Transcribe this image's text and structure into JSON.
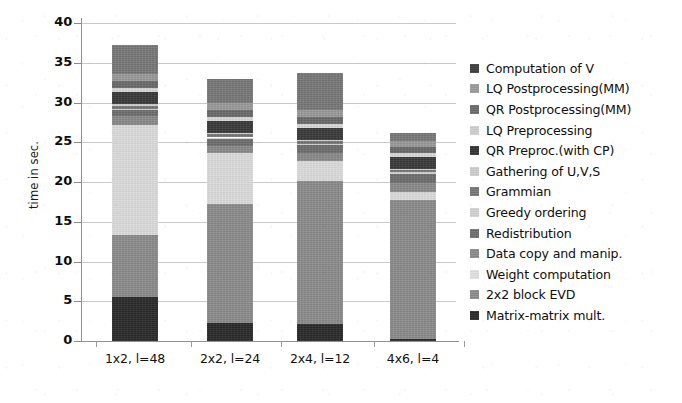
{
  "chart_data": {
    "type": "bar",
    "variant": "stacked",
    "title": "",
    "xlabel": "",
    "ylabel": "time in sec.",
    "ylim": [
      0,
      40
    ],
    "ytick_values": [
      0,
      5,
      10,
      15,
      20,
      25,
      30,
      35,
      40
    ],
    "ytick_labels": [
      "0",
      "5",
      "10",
      "15",
      "20",
      "25",
      "30",
      "35",
      "40"
    ],
    "grid": true,
    "legend_position": "right",
    "categories": [
      "1x2, l=48",
      "2x2, l=24",
      "2x4, l=12",
      "4x6, l=4"
    ],
    "stack_order_bottom_to_top": [
      "Matrix-matrix mult.",
      "2x2 block EVD",
      "Weight computation",
      "Data copy and manip.",
      "Redistribution",
      "Greedy ordering",
      "Grammian",
      "Gathering of U,V,S",
      "QR Preproc.(with CP)",
      "LQ Preprocessing",
      "QR Postprocessing(MM)",
      "LQ Postprocessing(MM)",
      "Computation of V"
    ],
    "series": [
      {
        "name": "Matrix-matrix mult.",
        "color": "#2a2a2a",
        "values": [
          5.5,
          2.3,
          2.2,
          0.3
        ]
      },
      {
        "name": "2x2 block EVD",
        "color": "#8c8c8c",
        "values": [
          7.8,
          14.9,
          17.9,
          17.4
        ]
      },
      {
        "name": "Weight computation",
        "color": "#dcdcdc",
        "values": [
          13.9,
          6.4,
          2.5,
          1.1
        ]
      },
      {
        "name": "Data copy and manip.",
        "color": "#8a8a8a",
        "values": [
          1.1,
          0.9,
          1.0,
          1.1
        ]
      },
      {
        "name": "Redistribution",
        "color": "#6e6e6e",
        "values": [
          0.7,
          0.9,
          1.0,
          1.1
        ]
      },
      {
        "name": "Greedy ordering",
        "color": "#d0d0d0",
        "values": [
          0.2,
          0.2,
          0.2,
          0.2
        ]
      },
      {
        "name": "Grammian",
        "color": "#767676",
        "values": [
          0.4,
          0.4,
          0.3,
          0.3
        ]
      },
      {
        "name": "Gathering of U,V,S",
        "color": "#cfcfcf",
        "values": [
          0.2,
          0.2,
          0.2,
          0.2
        ]
      },
      {
        "name": "QR Preproc.(with CP)",
        "color": "#3a3a3a",
        "values": [
          1.5,
          1.5,
          1.5,
          1.4
        ]
      },
      {
        "name": "LQ Preprocessing",
        "color": "#d8d8d8",
        "values": [
          0.5,
          0.5,
          0.5,
          0.5
        ]
      },
      {
        "name": "QR Postprocessing(MM)",
        "color": "#6a6a6a",
        "values": [
          0.9,
          0.9,
          0.9,
          0.8
        ]
      },
      {
        "name": "LQ Postprocessing(MM)",
        "color": "#9a9a9a",
        "values": [
          0.9,
          0.9,
          0.9,
          0.8
        ]
      },
      {
        "name": "Computation of V",
        "color": "#787878",
        "values": [
          3.6,
          3.0,
          4.6,
          1.0
        ]
      }
    ],
    "bar_totals": [
      37.2,
      32.1,
      32.7,
      26.1
    ]
  },
  "axis": {
    "y_label": "time in sec."
  },
  "legend": {
    "items": [
      {
        "label": "Computation of V",
        "color": "#3d3d3d"
      },
      {
        "label": "LQ Postprocessing(MM)",
        "color": "#9a9a9a"
      },
      {
        "label": "QR Postprocessing(MM)",
        "color": "#6a6a6a"
      },
      {
        "label": "LQ Preprocessing",
        "color": "#cfcfcf"
      },
      {
        "label": "QR Preproc.(with CP)",
        "color": "#333333"
      },
      {
        "label": "Gathering of U,V,S",
        "color": "#cccccc"
      },
      {
        "label": "Grammian",
        "color": "#767676"
      },
      {
        "label": "Greedy ordering",
        "color": "#d2d2d2"
      },
      {
        "label": "Redistribution",
        "color": "#6e6e6e"
      },
      {
        "label": "Data copy and manip.",
        "color": "#8a8a8a"
      },
      {
        "label": "Weight computation",
        "color": "#e0e0e0"
      },
      {
        "label": "2x2 block EVD",
        "color": "#8c8c8c"
      },
      {
        "label": "Matrix-matrix mult.",
        "color": "#2a2a2a"
      }
    ]
  }
}
